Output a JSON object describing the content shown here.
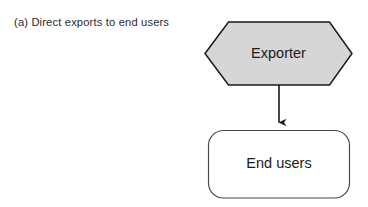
{
  "figure": {
    "caption": "(a) Direct exports to end users",
    "background_color": "#ffffff",
    "nodes": [
      {
        "id": "exporter",
        "label": "Exporter",
        "shape": "hexagon",
        "fill_color": "#d6d6d6",
        "stroke_color": "#1a1a1a"
      },
      {
        "id": "end-users",
        "label": "End users",
        "shape": "rounded-rectangle",
        "fill_color": "#ffffff",
        "stroke_color": "#4a4a4a"
      }
    ],
    "connectors": [
      {
        "id": "exporter-to-end-users",
        "from": "exporter",
        "to": "end-users",
        "style": "solid-arrow",
        "color": "#1a1a1a"
      }
    ]
  }
}
